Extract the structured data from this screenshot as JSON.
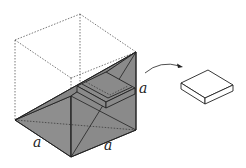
{
  "diagram": {
    "type": "geometry",
    "labels": {
      "edge_left": "a",
      "edge_right": "a",
      "edge_vertical": "a"
    },
    "colors": {
      "shade": "#8c8c8c",
      "shade_dark": "#7a7a7a",
      "line": "#222222",
      "dotted": "#555555"
    },
    "arrow": {
      "from": "slab in cube",
      "to": "extracted slab"
    }
  }
}
